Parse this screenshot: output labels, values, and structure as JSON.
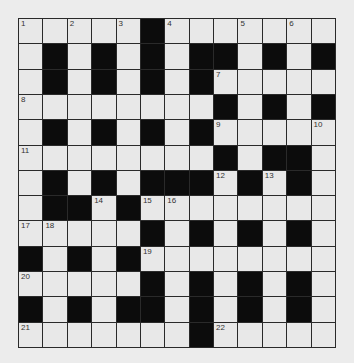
{
  "puzzle": {
    "rows": 13,
    "cols": 13,
    "layout": [
      ".....#.......",
      ".#.#.#.##.#.#",
      ".#.#.#.#.....",
      "........#.#.#",
      ".#.#.#.#.....",
      "........#.##.",
      ".#.#.###.#.#.",
      ".##.#........",
      ".....#.#.#.#.",
      "#.#.#........",
      ".....#.#.#.#.",
      "#.#.##.#.#.#.",
      ".......#....."
    ],
    "numbers": [
      {
        "row": 0,
        "col": 0,
        "n": "1"
      },
      {
        "row": 0,
        "col": 2,
        "n": "2"
      },
      {
        "row": 0,
        "col": 4,
        "n": "3"
      },
      {
        "row": 0,
        "col": 6,
        "n": "4"
      },
      {
        "row": 0,
        "col": 9,
        "n": "5"
      },
      {
        "row": 0,
        "col": 11,
        "n": "6"
      },
      {
        "row": 2,
        "col": 8,
        "n": "7"
      },
      {
        "row": 3,
        "col": 0,
        "n": "8"
      },
      {
        "row": 4,
        "col": 8,
        "n": "9"
      },
      {
        "row": 4,
        "col": 12,
        "n": "10"
      },
      {
        "row": 5,
        "col": 0,
        "n": "11"
      },
      {
        "row": 6,
        "col": 8,
        "n": "12"
      },
      {
        "row": 6,
        "col": 10,
        "n": "13"
      },
      {
        "row": 7,
        "col": 3,
        "n": "14"
      },
      {
        "row": 7,
        "col": 5,
        "n": "15"
      },
      {
        "row": 7,
        "col": 6,
        "n": "16"
      },
      {
        "row": 8,
        "col": 0,
        "n": "17"
      },
      {
        "row": 8,
        "col": 1,
        "n": "18"
      },
      {
        "row": 9,
        "col": 5,
        "n": "19"
      },
      {
        "row": 10,
        "col": 0,
        "n": "20"
      },
      {
        "row": 12,
        "col": 0,
        "n": "21"
      },
      {
        "row": 12,
        "col": 8,
        "n": "22"
      }
    ]
  },
  "colors": {
    "block": "#0c0c0c",
    "cell": "#e8e8e8",
    "line": "#2a2a2a",
    "background": "#ececec"
  }
}
